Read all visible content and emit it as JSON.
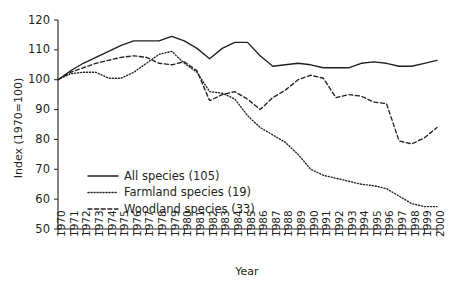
{
  "chart_data": {
    "type": "line",
    "title": "",
    "xlabel": "Year",
    "ylabel": "Index (1970=100)",
    "ylim": [
      50,
      120
    ],
    "yticks": [
      50,
      60,
      70,
      80,
      90,
      100,
      110,
      120
    ],
    "grid": false,
    "legend_position": "lower-left-inside",
    "x": [
      1970,
      1971,
      1972,
      1973,
      1974,
      1975,
      1976,
      1977,
      1978,
      1979,
      1980,
      1981,
      1982,
      1983,
      1984,
      1985,
      1986,
      1987,
      1988,
      1989,
      1990,
      1991,
      1992,
      1993,
      1994,
      1995,
      1996,
      1997,
      1998,
      1999,
      2000
    ],
    "xtick_labels": [
      "1970",
      "1971",
      "1972",
      "1973",
      "1974",
      "1975",
      "1976",
      "1977",
      "1978",
      "1979",
      "1980",
      "1981",
      "1982",
      "1983",
      "1984",
      "1985",
      "1986",
      "1987",
      "1988",
      "1989",
      "1990",
      "1991",
      "1992",
      "1993",
      "1994",
      "1995",
      "1996",
      "1997",
      "1998",
      "1999",
      "2000"
    ],
    "series": [
      {
        "name": "All species (105)",
        "style": "solid",
        "values": [
          100,
          103,
          105.5,
          107.5,
          109.5,
          111.5,
          113,
          113,
          113,
          114.5,
          113,
          110.5,
          107,
          110.5,
          112.5,
          112.5,
          108,
          104.5,
          105,
          105.5,
          105,
          104,
          104,
          104,
          105.5,
          106,
          105.5,
          104.5,
          104.5,
          105.5,
          106.5
        ]
      },
      {
        "name": "Farmland species (19)",
        "style": "dotted",
        "values": [
          100,
          102,
          102.5,
          102.5,
          100.5,
          100.5,
          102.5,
          105.5,
          108.5,
          109.5,
          105.5,
          102.5,
          96,
          95.5,
          93.5,
          88,
          84,
          81.5,
          79,
          75,
          70,
          68,
          67,
          66,
          65,
          64.5,
          63.5,
          61,
          58.5,
          57.5,
          57.5
        ]
      },
      {
        "name": "Woodland species (33)",
        "style": "dashed",
        "values": [
          100,
          102.5,
          104,
          105.5,
          106.5,
          107.5,
          108,
          107.5,
          105.5,
          105,
          106,
          103,
          93,
          95,
          96,
          93.5,
          90,
          94,
          96.5,
          100,
          101.5,
          100.5,
          94,
          95,
          94.5,
          92.5,
          92,
          79.5,
          78.5,
          80.5,
          84
        ]
      }
    ]
  },
  "axes": {
    "y_label": "Index (1970=100)",
    "x_label": "Year"
  },
  "legend": {
    "items": [
      {
        "label": "All species (105)",
        "style": "solid"
      },
      {
        "label": "Farmland species (19)",
        "style": "dotted"
      },
      {
        "label": "Woodland species (33)",
        "style": "dashed"
      }
    ]
  },
  "colors": {
    "ink": "#231f20",
    "background": "#ffffff"
  }
}
